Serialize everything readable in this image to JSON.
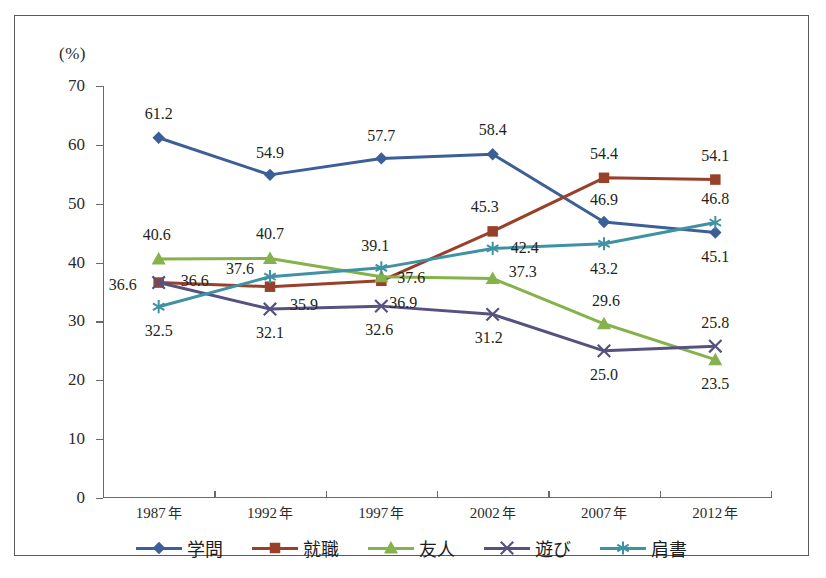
{
  "chart_data": {
    "type": "line",
    "title": "",
    "xlabel": "",
    "ylabel": "(%)",
    "unit_label": "(%)",
    "categories": [
      "1987 年",
      "1992 年",
      "1997 年",
      "2002 年",
      "2007 年",
      "2012 年"
    ],
    "ylim": [
      0,
      70
    ],
    "yticks": [
      0,
      10,
      20,
      30,
      40,
      50,
      60,
      70
    ],
    "ytick_labels": [
      "0",
      "10",
      "20",
      "30",
      "40",
      "50",
      "60",
      "70"
    ],
    "grid": false,
    "legend_position": "bottom",
    "series": [
      {
        "name": "学問",
        "color": "#3c5f97",
        "marker": "diamond",
        "values": [
          61.2,
          54.9,
          57.7,
          58.4,
          46.9,
          45.1
        ],
        "labels": [
          "61.2",
          "54.9",
          "57.7",
          "58.4",
          "46.9",
          "45.1"
        ]
      },
      {
        "name": "就職",
        "color": "#99402b",
        "marker": "square",
        "values": [
          36.6,
          35.9,
          36.9,
          45.3,
          54.4,
          54.1
        ],
        "labels": [
          "36.6",
          "35.9",
          "36.9",
          "45.3",
          "54.4",
          "54.1"
        ]
      },
      {
        "name": "友人",
        "color": "#85b24a",
        "marker": "triangle",
        "values": [
          40.6,
          40.7,
          37.6,
          37.3,
          29.6,
          23.5
        ],
        "labels": [
          "40.6",
          "40.7",
          "37.6",
          "37.3",
          "29.6",
          "23.5"
        ]
      },
      {
        "name": "遊び",
        "color": "#56527f",
        "marker": "x",
        "values": [
          36.6,
          32.1,
          32.6,
          31.2,
          25.0,
          25.8
        ],
        "labels": [
          "36.6",
          "32.1",
          "32.6",
          "31.2",
          "25.0",
          "25.8"
        ]
      },
      {
        "name": "肩書",
        "color": "#3f92a3",
        "marker": "asterisk",
        "values": [
          32.5,
          37.6,
          39.1,
          42.4,
          43.2,
          46.8
        ],
        "labels": [
          "32.5",
          "37.6",
          "39.1",
          "42.4",
          "43.2",
          "46.8"
        ]
      }
    ],
    "point_labels": [
      {
        "series": "学問",
        "x": 0,
        "text": "61.2",
        "dx": 0,
        "dy": -24
      },
      {
        "series": "学問",
        "x": 1,
        "text": "54.9",
        "dx": 0,
        "dy": -22
      },
      {
        "series": "学問",
        "x": 2,
        "text": "57.7",
        "dx": 0,
        "dy": -22
      },
      {
        "series": "学問",
        "x": 3,
        "text": "58.4",
        "dx": 0,
        "dy": -24
      },
      {
        "series": "学問",
        "x": 4,
        "text": "46.9",
        "dx": 0,
        "dy": -22
      },
      {
        "series": "学問",
        "x": 5,
        "text": "45.1",
        "dx": 0,
        "dy": 24
      },
      {
        "series": "就職",
        "x": 0,
        "text": "36.6",
        "dx": -36,
        "dy": 2
      },
      {
        "series": "就職",
        "x": 1,
        "text": "35.9",
        "dx": 34,
        "dy": 18
      },
      {
        "series": "就職",
        "x": 2,
        "text": "36.9",
        "dx": 22,
        "dy": 22
      },
      {
        "series": "就職",
        "x": 3,
        "text": "45.3",
        "dx": -8,
        "dy": -24
      },
      {
        "series": "就職",
        "x": 4,
        "text": "54.4",
        "dx": 0,
        "dy": -24
      },
      {
        "series": "就職",
        "x": 5,
        "text": "54.1",
        "dx": 0,
        "dy": -24
      },
      {
        "series": "友人",
        "x": 0,
        "text": "40.6",
        "dx": -2,
        "dy": -24
      },
      {
        "series": "友人",
        "x": 1,
        "text": "40.7",
        "dx": 0,
        "dy": -24
      },
      {
        "series": "友人",
        "x": 2,
        "text": "37.6",
        "dx": 30,
        "dy": 1
      },
      {
        "series": "友人",
        "x": 3,
        "text": "37.3",
        "dx": 30,
        "dy": -6
      },
      {
        "series": "友人",
        "x": 4,
        "text": "29.6",
        "dx": 2,
        "dy": -23
      },
      {
        "series": "友人",
        "x": 5,
        "text": "23.5",
        "dx": 0,
        "dy": 24
      },
      {
        "series": "遊び",
        "x": 0,
        "text": "36.6",
        "dx": 36,
        "dy": -2
      },
      {
        "series": "遊び",
        "x": 1,
        "text": "32.1",
        "dx": 0,
        "dy": 24
      },
      {
        "series": "遊び",
        "x": 2,
        "text": "32.6",
        "dx": -2,
        "dy": 24
      },
      {
        "series": "遊び",
        "x": 3,
        "text": "31.2",
        "dx": -4,
        "dy": 24
      },
      {
        "series": "遊び",
        "x": 4,
        "text": "25.0",
        "dx": 0,
        "dy": 24
      },
      {
        "series": "遊び",
        "x": 5,
        "text": "25.8",
        "dx": 0,
        "dy": -23
      },
      {
        "series": "肩書",
        "x": 0,
        "text": "32.5",
        "dx": 0,
        "dy": 24
      },
      {
        "series": "肩書",
        "x": 1,
        "text": "37.6",
        "dx": -30,
        "dy": -8
      },
      {
        "series": "肩書",
        "x": 2,
        "text": "39.1",
        "dx": -6,
        "dy": -22
      },
      {
        "series": "肩書",
        "x": 3,
        "text": "42.4",
        "dx": 32,
        "dy": 0
      },
      {
        "series": "肩書",
        "x": 4,
        "text": "43.2",
        "dx": 0,
        "dy": 25
      },
      {
        "series": "肩書",
        "x": 5,
        "text": "46.8",
        "dx": 0,
        "dy": -24
      }
    ]
  }
}
